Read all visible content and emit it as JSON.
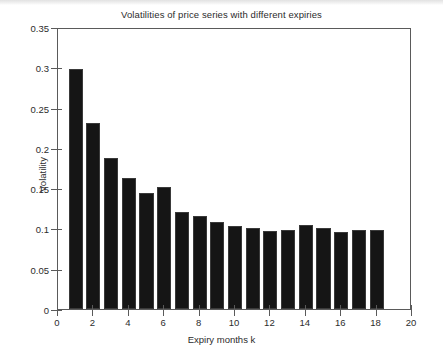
{
  "chart_data": {
    "type": "bar",
    "title": "Volatilities of price series with different expiries",
    "xlabel": "Expiry months k",
    "ylabel": "Volatility",
    "categories": [
      1,
      2,
      3,
      4,
      5,
      6,
      7,
      8,
      9,
      10,
      11,
      12,
      13,
      14,
      15,
      16,
      17,
      18
    ],
    "values": [
      0.298,
      0.231,
      0.187,
      0.162,
      0.144,
      0.151,
      0.121,
      0.115,
      0.108,
      0.103,
      0.101,
      0.097,
      0.098,
      0.104,
      0.101,
      0.095,
      0.098,
      0.098
    ],
    "xlim": [
      0,
      20
    ],
    "ylim": [
      0,
      0.35
    ],
    "xticks": [
      0,
      2,
      4,
      6,
      8,
      10,
      12,
      14,
      16,
      18,
      20
    ],
    "xticklabels": [
      "0",
      "2",
      "4",
      "6",
      "8",
      "10",
      "12",
      "14",
      "16",
      "18",
      "20"
    ],
    "yticks": [
      0,
      0.05,
      0.1,
      0.15,
      0.2,
      0.25,
      0.3,
      0.35
    ],
    "yticklabels": [
      "0",
      "0.05",
      "0.1",
      "0.15",
      "0.2",
      "0.25",
      "0.3",
      "0.35"
    ],
    "grid": false,
    "legend": null,
    "bar_color": "#151515",
    "bar_width": 0.8,
    "axes_color": "#5a5a5a",
    "background": "#ffffff"
  }
}
